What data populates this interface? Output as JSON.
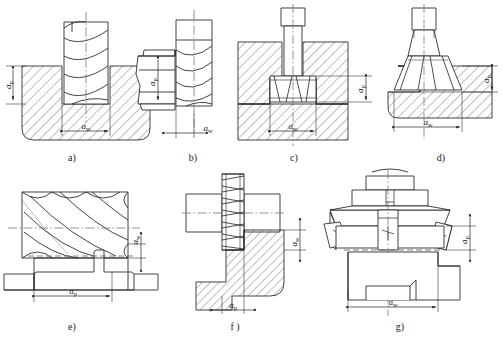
{
  "figure": {
    "background_color": "#ffffff",
    "line_color": "#222222",
    "hatch_color": "#333333",
    "centerline_color": "#555555"
  },
  "symbols": {
    "depth_of_cut": "a",
    "depth_of_cut_sub": "p",
    "width_of_cut": "a",
    "width_of_cut_sub": "w"
  },
  "panels": [
    {
      "id": "a",
      "caption": "a)",
      "tool": "end-mill",
      "dimensions": [
        {
          "name": "depth-of-cut",
          "label": "a",
          "sub": "p",
          "orientation": "vertical"
        },
        {
          "name": "width-of-cut",
          "label": "a",
          "sub": "w",
          "orientation": "horizontal"
        }
      ]
    },
    {
      "id": "b",
      "caption": "b)",
      "tool": "end-mill-side",
      "dimensions": [
        {
          "name": "depth-of-cut",
          "label": "a",
          "sub": "p",
          "orientation": "vertical"
        },
        {
          "name": "width-of-cut",
          "label": "a",
          "sub": "w",
          "orientation": "horizontal"
        }
      ]
    },
    {
      "id": "c",
      "caption": "c)",
      "tool": "t-slot-cutter",
      "dimensions": [
        {
          "name": "depth-of-cut",
          "label": "a",
          "sub": "p",
          "orientation": "vertical"
        },
        {
          "name": "width-of-cut",
          "label": "a",
          "sub": "w",
          "orientation": "horizontal"
        }
      ]
    },
    {
      "id": "d",
      "caption": "d)",
      "tool": "dovetail-cutter",
      "dimensions": [
        {
          "name": "depth-of-cut",
          "label": "a",
          "sub": "p",
          "orientation": "vertical"
        },
        {
          "name": "width-of-cut",
          "label": "a",
          "sub": "w",
          "orientation": "horizontal"
        }
      ]
    },
    {
      "id": "e",
      "caption": "e)",
      "tool": "slab-mill",
      "dimensions": [
        {
          "name": "width-of-cut",
          "label": "a",
          "sub": "w",
          "orientation": "vertical"
        },
        {
          "name": "depth-of-cut",
          "label": "a",
          "sub": "p",
          "orientation": "horizontal"
        }
      ]
    },
    {
      "id": "f",
      "caption": "f )",
      "tool": "side-and-face-cutter",
      "dimensions": [
        {
          "name": "width-of-cut",
          "label": "a",
          "sub": "w",
          "orientation": "vertical"
        },
        {
          "name": "depth-of-cut",
          "label": "a",
          "sub": "p",
          "orientation": "horizontal"
        }
      ]
    },
    {
      "id": "g",
      "caption": "g)",
      "tool": "face-mill",
      "dimensions": [
        {
          "name": "depth-of-cut",
          "label": "a",
          "sub": "p",
          "orientation": "vertical"
        },
        {
          "name": "width-of-cut",
          "label": "a",
          "sub": "w",
          "orientation": "horizontal"
        }
      ]
    }
  ]
}
